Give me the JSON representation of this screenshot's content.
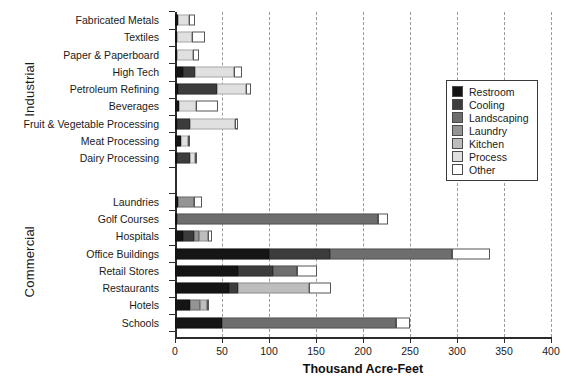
{
  "chart_data": {
    "type": "bar",
    "orientation": "horizontal",
    "stacked": true,
    "title": "",
    "xlabel": "Thousand Acre-Feet",
    "ylabel": "",
    "xlim": [
      0,
      400
    ],
    "xticks": [
      0,
      50,
      100,
      150,
      200,
      250,
      300,
      350,
      400
    ],
    "xtick_labels": [
      "0",
      "50",
      "100",
      "150",
      "200",
      "250",
      "300",
      "350",
      "400"
    ],
    "grid": "vertical dashed gridlines at each 50 unit tick",
    "legend_position": "upper right, inside plot",
    "series": [
      {
        "name": "Restroom",
        "color": "#151515"
      },
      {
        "name": "Cooling",
        "color": "#3c3c3c"
      },
      {
        "name": "Landscaping",
        "color": "#6e6e6e"
      },
      {
        "name": "Laundry",
        "color": "#949494"
      },
      {
        "name": "Kitchen",
        "color": "#bdbdbd"
      },
      {
        "name": "Process",
        "color": "#e0e0e0"
      },
      {
        "name": "Other",
        "color": "#ffffff"
      }
    ],
    "groups": [
      {
        "label": "Industrial",
        "categories": [
          "Fabricated Metals",
          "Textiles",
          "Paper & Paperboard",
          "High Tech",
          "Petroleum Refining",
          "Beverages",
          "Fruit & Vegetable Processing",
          "Meat Processing",
          "Dairy Processing"
        ],
        "values": [
          {
            "category": "Fabricated Metals",
            "Restroom": 3,
            "Cooling": 0,
            "Landscaping": 0,
            "Laundry": 0,
            "Kitchen": 0,
            "Process": 12,
            "Other": 6
          },
          {
            "category": "Textiles",
            "Restroom": 1,
            "Cooling": 0,
            "Landscaping": 0,
            "Laundry": 0,
            "Kitchen": 0,
            "Process": 16,
            "Other": 14
          },
          {
            "category": "Paper & Paperboard",
            "Restroom": 1,
            "Cooling": 0,
            "Landscaping": 0,
            "Laundry": 0,
            "Kitchen": 0,
            "Process": 17,
            "Other": 6
          },
          {
            "category": "High Tech",
            "Restroom": 9,
            "Cooling": 12,
            "Landscaping": 0,
            "Laundry": 0,
            "Kitchen": 0,
            "Process": 42,
            "Other": 8
          },
          {
            "category": "Petroleum Refining",
            "Restroom": 3,
            "Cooling": 42,
            "Landscaping": 0,
            "Laundry": 0,
            "Kitchen": 0,
            "Process": 31,
            "Other": 5
          },
          {
            "category": "Beverages",
            "Restroom": 4,
            "Cooling": 0,
            "Landscaping": 0,
            "Laundry": 0,
            "Kitchen": 0,
            "Process": 18,
            "Other": 24
          },
          {
            "category": "Fruit & Vegetable Processing",
            "Restroom": 2,
            "Cooling": 14,
            "Landscaping": 0,
            "Laundry": 0,
            "Kitchen": 0,
            "Process": 48,
            "Other": 3
          },
          {
            "category": "Meat Processing",
            "Restroom": 6,
            "Cooling": 0,
            "Landscaping": 0,
            "Laundry": 0,
            "Kitchen": 0,
            "Process": 8,
            "Other": 2
          },
          {
            "category": "Dairy Processing",
            "Restroom": 1,
            "Cooling": 14,
            "Landscaping": 0,
            "Laundry": 0,
            "Kitchen": 0,
            "Process": 5,
            "Other": 2
          }
        ]
      },
      {
        "label": "Commercial",
        "categories": [
          "Laundries",
          "Golf Courses",
          "Hospitals",
          "Office Buildings",
          "Retail Stores",
          "Restaurants",
          "Hotels",
          "Schools"
        ],
        "values": [
          {
            "category": "Laundries",
            "Restroom": 3,
            "Cooling": 0,
            "Landscaping": 0,
            "Laundry": 17,
            "Kitchen": 0,
            "Process": 0,
            "Other": 9
          },
          {
            "category": "Golf Courses",
            "Restroom": 1,
            "Cooling": 0,
            "Landscaping": 214,
            "Laundry": 0,
            "Kitchen": 0,
            "Process": 0,
            "Other": 11
          },
          {
            "category": "Hospitals",
            "Restroom": 9,
            "Cooling": 11,
            "Landscaping": 0,
            "Laundry": 6,
            "Kitchen": 9,
            "Process": 0,
            "Other": 4
          },
          {
            "category": "Office Buildings",
            "Restroom": 100,
            "Cooling": 65,
            "Landscaping": 130,
            "Laundry": 0,
            "Kitchen": 0,
            "Process": 0,
            "Other": 40
          },
          {
            "category": "Retail Stores",
            "Restroom": 67,
            "Cooling": 37,
            "Landscaping": 26,
            "Laundry": 0,
            "Kitchen": 0,
            "Process": 0,
            "Other": 21
          },
          {
            "category": "Restaurants",
            "Restroom": 57,
            "Cooling": 10,
            "Landscaping": 0,
            "Laundry": 0,
            "Kitchen": 76,
            "Process": 0,
            "Other": 23
          },
          {
            "category": "Hotels",
            "Restroom": 16,
            "Cooling": 0,
            "Landscaping": 0,
            "Laundry": 11,
            "Kitchen": 7,
            "Process": 0,
            "Other": 2
          },
          {
            "category": "Schools",
            "Restroom": 50,
            "Cooling": 0,
            "Landscaping": 185,
            "Laundry": 0,
            "Kitchen": 0,
            "Process": 0,
            "Other": 15
          }
        ]
      }
    ]
  }
}
